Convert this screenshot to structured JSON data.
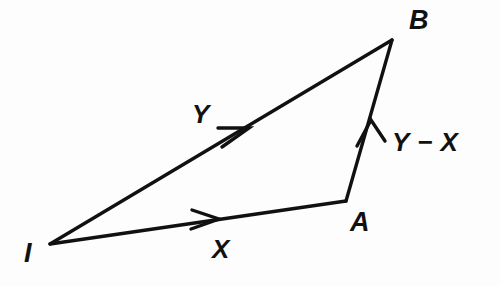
{
  "diagram": {
    "background_color": "#fdfdfd",
    "stroke_color": "#111111",
    "width": 500,
    "height": 286,
    "points": {
      "I": {
        "label": "I",
        "x": 50,
        "y": 244
      },
      "A": {
        "label": "A",
        "x": 346,
        "y": 201
      },
      "B": {
        "label": "B",
        "x": 392,
        "y": 40
      }
    },
    "vectors": [
      {
        "name": "x-vector",
        "label": "X",
        "from": "I",
        "to": "A",
        "arrow_tip_x": 218,
        "arrow_tip_y": 219
      },
      {
        "name": "y-vector",
        "label": "Y",
        "from": "I",
        "to": "B",
        "arrow_tip_x": 248,
        "arrow_tip_y": 128
      },
      {
        "name": "y-minus-x-vector",
        "label": "Y − X",
        "from": "A",
        "to": "B",
        "arrow_tip_x": 370,
        "arrow_tip_y": 122
      }
    ],
    "labels": {
      "point_i": "I",
      "point_a": "A",
      "point_b": "B",
      "vector_x": "X",
      "vector_y": "Y",
      "vector_y_minus_x": "Y − X"
    }
  }
}
